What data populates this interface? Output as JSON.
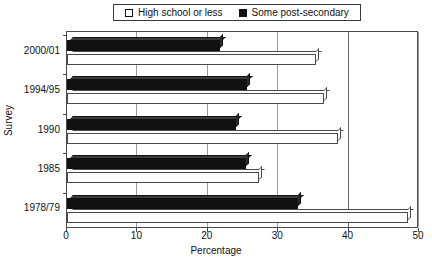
{
  "chart_data": {
    "type": "bar",
    "orientation": "horizontal",
    "title": "",
    "xlabel": "Percentage",
    "ylabel": "Survey",
    "categories": [
      "2000/01",
      "1994/95",
      "1990",
      "1985",
      "1978/79"
    ],
    "series": [
      {
        "name": "High school or less",
        "swatch": "hollow-square",
        "color": "#ffffff",
        "values": [
          35.4,
          36.5,
          38.5,
          27.3,
          48.4
        ]
      },
      {
        "name": "Some post-secondary",
        "swatch": "filled-square",
        "color": "#111111",
        "values": [
          21.7,
          25.6,
          24.0,
          25.4,
          32.8
        ]
      }
    ],
    "xlim": [
      0,
      50
    ],
    "xticks": [
      0,
      10,
      20,
      30,
      40,
      50
    ],
    "xtick_labels": [
      "0",
      "10",
      "20",
      "30",
      "40",
      "50"
    ],
    "grid": true,
    "grid_axis": "x",
    "legend_position": "top-center"
  },
  "legend": {
    "entries": [
      {
        "label": "High school or less"
      },
      {
        "label": "Some post-secondary"
      }
    ]
  },
  "axes": {
    "x_title": "Percentage",
    "y_title": "Survey"
  }
}
